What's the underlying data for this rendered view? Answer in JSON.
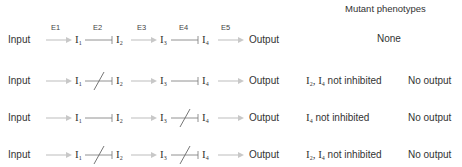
{
  "header": {
    "title": "Mutant phenotypes"
  },
  "colors": {
    "activation_arrow": "#c8c8c8",
    "inhibition_line": "#666666",
    "text": "#333333"
  },
  "enzymes": [
    "E1",
    "E2",
    "E3",
    "E4",
    "E5"
  ],
  "pathway": {
    "input_label": "Input",
    "output_label": "Output",
    "intermediates": [
      {
        "base": "I",
        "sub": "1"
      },
      {
        "base": "I",
        "sub": "2"
      },
      {
        "base": "I",
        "sub": "3"
      },
      {
        "base": "I",
        "sub": "4"
      }
    ]
  },
  "rows": [
    {
      "e2_mutant": false,
      "e4_mutant": false,
      "phenotype_base": "None",
      "phenotype_suffix": "",
      "output": ""
    },
    {
      "e2_mutant": true,
      "e4_mutant": false,
      "phenotype_base": "I",
      "phenotype_sub1": "2",
      "phenotype_mid": ", I",
      "phenotype_sub2": "4",
      "phenotype_suffix": " not inhibited",
      "output": "No output"
    },
    {
      "e2_mutant": false,
      "e4_mutant": true,
      "phenotype_base": "I",
      "phenotype_sub1": "4",
      "phenotype_suffix": " not inhibited",
      "output": "No output"
    },
    {
      "e2_mutant": true,
      "e4_mutant": true,
      "phenotype_base": "I",
      "phenotype_sub1": "2",
      "phenotype_mid": ", I",
      "phenotype_sub2": "4",
      "phenotype_suffix": " not inhibited",
      "output": "No output"
    }
  ]
}
